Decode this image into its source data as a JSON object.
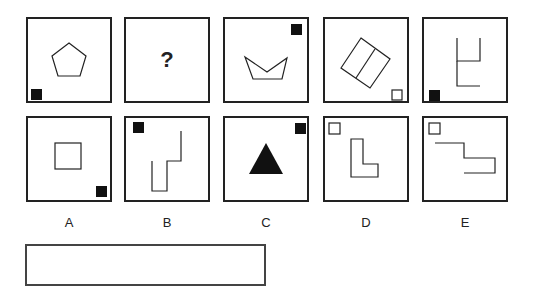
{
  "puzzle": {
    "top_row": [
      {
        "id": "t1",
        "shape": "pentagon-outline",
        "marker": "black-square",
        "marker_pos": "bottom-left"
      },
      {
        "id": "t2",
        "text": "?"
      },
      {
        "id": "t3",
        "shape": "concave-pentagon-outline",
        "marker": "black-square",
        "marker_pos": "top-right"
      },
      {
        "id": "t4",
        "shape": "rotated-divided-rectangle-outline",
        "marker": "white-square",
        "marker_pos": "bottom-right"
      },
      {
        "id": "t5",
        "shape": "open-line-figure",
        "marker": "black-square",
        "marker_pos": "bottom-left"
      }
    ],
    "options": [
      {
        "label": "A",
        "shape": "square-outline",
        "marker": "black-square",
        "marker_pos": "bottom-right"
      },
      {
        "label": "B",
        "shape": "zigzag-line",
        "marker": "black-square",
        "marker_pos": "top-left"
      },
      {
        "label": "C",
        "shape": "filled-triangle",
        "marker": "black-square",
        "marker_pos": "top-right"
      },
      {
        "label": "D",
        "shape": "l-shape-outline",
        "marker": "white-square",
        "marker_pos": "top-left"
      },
      {
        "label": "E",
        "shape": "step-line",
        "marker": "white-square",
        "marker_pos": "top-left"
      }
    ],
    "answer_box": ""
  }
}
